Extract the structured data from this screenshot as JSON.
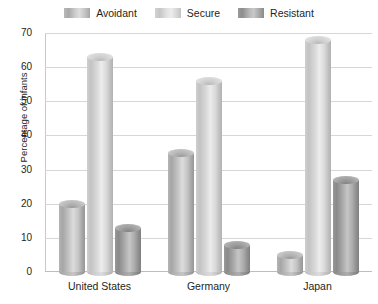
{
  "chart_data": {
    "type": "bar",
    "title": "",
    "subtitle": "",
    "xlabel": "",
    "ylabel": "Percentage of infants",
    "categories": [
      "United States",
      "Germany",
      "Japan"
    ],
    "series": [
      {
        "name": "Avoidant",
        "values": [
          20,
          35,
          5
        ],
        "color": "#b4b4b4"
      },
      {
        "name": "Secure",
        "values": [
          63,
          56,
          68
        ],
        "color": "#d4d4d4"
      },
      {
        "name": "Resistant",
        "values": [
          13,
          8,
          27
        ],
        "color": "#969696"
      }
    ],
    "ylim": [
      0,
      70
    ],
    "yticks": [
      0,
      10,
      20,
      30,
      40,
      50,
      60,
      70
    ],
    "ytick_labels": [
      "0",
      "10",
      "20",
      "30",
      "40",
      "50",
      "60",
      "70"
    ],
    "grid": true,
    "legend_position": "top",
    "bar_style": "3d-cylinder"
  },
  "legend": {
    "entries": [
      {
        "label": "Avoidant",
        "swatch": "avoidant-swatch"
      },
      {
        "label": "Secure",
        "swatch": "secure-swatch"
      },
      {
        "label": "Resistant",
        "swatch": "resistant-swatch"
      }
    ]
  },
  "axes": {
    "y_title": "Percentage of infants",
    "y_labels": [
      "70",
      "60",
      "50",
      "40",
      "30",
      "20",
      "10",
      "0"
    ],
    "x_labels": [
      "United States",
      "Germany",
      "Japan"
    ]
  }
}
